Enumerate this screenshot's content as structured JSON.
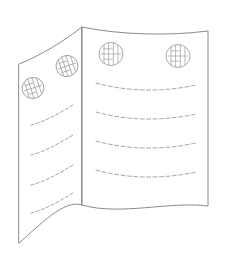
{
  "figure": {
    "kind": "line-art-illustration",
    "background_color": "#ffffff",
    "outline_color": "#8a8a8a",
    "text_line_color": "#9a9a9a",
    "seal_color": "#a0a0a0",
    "canvas": {
      "width": 236,
      "height": 274
    }
  },
  "panels": [
    {
      "id": "left-panel",
      "label": "Left panel",
      "orientation": "receding-left",
      "outline_path": "M19,64 C40,56 64,41 82,27 L82,205 C64,199 40,225 19,243 Z",
      "seals": [
        {
          "id": "left-seal-lower",
          "label": "Seal",
          "cx": 33,
          "cy": 88,
          "rx": 11,
          "ry": 10.5,
          "tilt": -18
        },
        {
          "id": "left-seal-upper",
          "label": "Seal",
          "cx": 67,
          "cy": 66,
          "rx": 11,
          "ry": 10.5,
          "tilt": -18
        }
      ],
      "text_lines": [
        {
          "id": "left-line-1",
          "path": "M31,125 C44,122 58,114 73,105"
        },
        {
          "id": "left-line-2",
          "path": "M31,155 C44,152 58,144 73,135"
        },
        {
          "id": "left-line-3",
          "path": "M31,185 C44,182 58,174 73,165"
        },
        {
          "id": "left-line-4",
          "path": "M31,213 C44,210 58,202 73,193"
        }
      ]
    },
    {
      "id": "right-panel",
      "label": "Right panel",
      "orientation": "facing-front",
      "outline_path": "M82,27 C120,35 170,36 208,31 L208,206 C170,201 120,216 82,205 Z",
      "seals": [
        {
          "id": "right-seal-left",
          "label": "Seal",
          "cx": 111,
          "cy": 54,
          "rx": 12,
          "ry": 11.5,
          "tilt": 0
        },
        {
          "id": "right-seal-right",
          "label": "Seal",
          "cx": 178,
          "cy": 56,
          "rx": 12,
          "ry": 11.5,
          "tilt": 0
        }
      ],
      "text_lines": [
        {
          "id": "right-line-1",
          "path": "M96,83 C128,92 164,92 196,85"
        },
        {
          "id": "right-line-2",
          "path": "M96,112 C128,121 164,121 196,114"
        },
        {
          "id": "right-line-3",
          "path": "M96,141 C128,150 164,150 196,143"
        },
        {
          "id": "right-line-4",
          "path": "M96,170 C128,179 164,179 196,172"
        }
      ]
    }
  ],
  "fold": {
    "id": "center-fold",
    "label": "Center fold",
    "path": "M82,27 L82,205"
  }
}
